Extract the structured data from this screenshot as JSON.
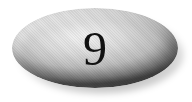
{
  "button": {
    "label": "9",
    "shape": "oval",
    "colors": {
      "highlight": "#f2f2f2",
      "midtone": "#bdbdbd",
      "edge": "#5a5a5a",
      "text": "#111111",
      "background": "#ffffff"
    }
  }
}
